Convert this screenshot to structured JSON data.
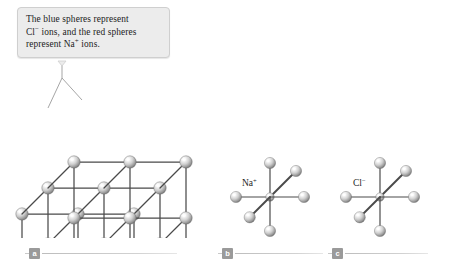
{
  "figure": {
    "background_color": "#ffffff"
  },
  "callout": {
    "text_part_1": "The blue spheres represent",
    "text_part_2_a": "Cl",
    "text_part_2_charge": "−",
    "text_part_2_b": " ions, and the red spheres",
    "text_part_3_a": "represent Na",
    "text_part_3_charge": "+",
    "text_part_3_b": " ions.",
    "full_text": "The blue spheres represent Cl⁻ ions, and the red spheres represent Na⁺ ions.",
    "background_color": "#ececec",
    "border_color": "#cfcfcf"
  },
  "panels": [
    {
      "id": "a",
      "badge": "a",
      "name": "crystal-lattice-panel",
      "description": "3x3x3 rock-salt cubic lattice drawn in isometric projection with alternating ion spheres at every grid node"
    },
    {
      "id": "b",
      "badge": "b",
      "name": "sodium-ion-coordination-panel",
      "label_element": "Na",
      "label_charge": "+",
      "label_full": "Na⁺",
      "description": "Central Na+ ion octahedrally coordinated by six chloride spheres"
    },
    {
      "id": "c",
      "badge": "c",
      "name": "chloride-ion-coordination-panel",
      "label_element": "Cl",
      "label_charge": "−",
      "label_full": "Cl⁻",
      "description": "Central Cl- ion octahedrally coordinated by six sodium spheres"
    }
  ],
  "colors": {
    "sphere_highlight": "#ffffff",
    "sphere_mid": "#d2d2d2",
    "sphere_shadow": "#777777",
    "bond_line": "#4a4a4a",
    "badge_fill": "#9a9a9a",
    "badge_text": "#ffffff",
    "rule": "#c9c9c9",
    "leader_line": "#9b9b9b",
    "text": "#1d1d1d"
  },
  "geometry": {
    "lattice_grid": 3,
    "coordination_number": 6,
    "sphere_radius_lattice": 6.2,
    "sphere_radius_outer": 5.6,
    "sphere_radius_center": 4.2
  }
}
